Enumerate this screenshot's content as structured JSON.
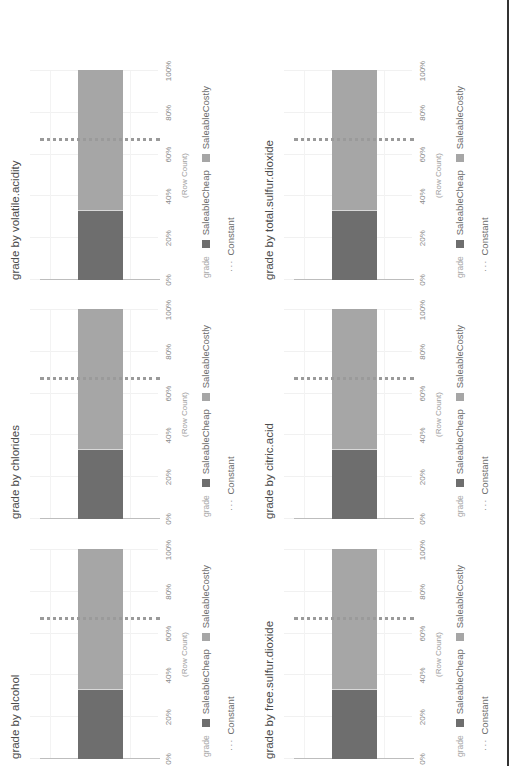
{
  "page": {
    "orientation": "rotated-90-ccw",
    "colors": {
      "saleable_cheap": "#6e6e6e",
      "saleable_costly": "#a6a6a6",
      "constant_line": "#9a9a9a",
      "axis": "#bdbdbd"
    }
  },
  "legend": {
    "title": "grade",
    "items": [
      {
        "label": "SaleableCheap",
        "color": "#6e6e6e"
      },
      {
        "label": "SaleableCostly",
        "color": "#a6a6a6"
      }
    ],
    "constant_label": "Constant",
    "constant_glyph": "···"
  },
  "axis": {
    "title": "(Row Count)",
    "ticks": [
      "0%",
      "20%",
      "40%",
      "60%",
      "80%",
      "100%"
    ]
  },
  "charts": [
    {
      "title": "grade by alcohol"
    },
    {
      "title": "grade by chlorides"
    },
    {
      "title": "grade by volatile.acidity"
    },
    {
      "title": "grade by free.sulfur.dioxide"
    },
    {
      "title": "grade by citric.acid"
    },
    {
      "title": "grade by total.sulfur.dioxide"
    }
  ],
  "chart_data": [
    {
      "type": "bar",
      "orientation": "horizontal-stacked-100",
      "title": "grade by alcohol",
      "categories": [
        ""
      ],
      "series": [
        {
          "name": "SaleableCheap",
          "values": [
            33
          ]
        },
        {
          "name": "SaleableCostly",
          "values": [
            67
          ]
        }
      ],
      "reference_line": {
        "name": "Constant",
        "value": 67
      },
      "xlabel": "(Row Count)",
      "xticks": [
        "0%",
        "20%",
        "40%",
        "60%",
        "80%",
        "100%"
      ],
      "xlim": [
        0,
        100
      ],
      "legend_title": "grade",
      "legend_position": "bottom",
      "grid": true
    },
    {
      "type": "bar",
      "orientation": "horizontal-stacked-100",
      "title": "grade by chlorides",
      "categories": [
        ""
      ],
      "series": [
        {
          "name": "SaleableCheap",
          "values": [
            33
          ]
        },
        {
          "name": "SaleableCostly",
          "values": [
            67
          ]
        }
      ],
      "reference_line": {
        "name": "Constant",
        "value": 67
      },
      "xlabel": "(Row Count)",
      "xticks": [
        "0%",
        "20%",
        "40%",
        "60%",
        "80%",
        "100%"
      ],
      "xlim": [
        0,
        100
      ],
      "legend_title": "grade",
      "legend_position": "bottom",
      "grid": true
    },
    {
      "type": "bar",
      "orientation": "horizontal-stacked-100",
      "title": "grade by volatile.acidity",
      "categories": [
        ""
      ],
      "series": [
        {
          "name": "SaleableCheap",
          "values": [
            33
          ]
        },
        {
          "name": "SaleableCostly",
          "values": [
            67
          ]
        }
      ],
      "reference_line": {
        "name": "Constant",
        "value": 67
      },
      "xlabel": "(Row Count)",
      "xticks": [
        "0%",
        "20%",
        "40%",
        "60%",
        "80%",
        "100%"
      ],
      "xlim": [
        0,
        100
      ],
      "legend_title": "grade",
      "legend_position": "bottom",
      "grid": true
    },
    {
      "type": "bar",
      "orientation": "horizontal-stacked-100",
      "title": "grade by free.sulfur.dioxide",
      "categories": [
        ""
      ],
      "series": [
        {
          "name": "SaleableCheap",
          "values": [
            33
          ]
        },
        {
          "name": "SaleableCostly",
          "values": [
            67
          ]
        }
      ],
      "reference_line": {
        "name": "Constant",
        "value": 67
      },
      "xlabel": "(Row Count)",
      "xticks": [
        "0%",
        "20%",
        "40%",
        "60%",
        "80%",
        "100%"
      ],
      "xlim": [
        0,
        100
      ],
      "legend_title": "grade",
      "legend_position": "bottom",
      "grid": true
    },
    {
      "type": "bar",
      "orientation": "horizontal-stacked-100",
      "title": "grade by citric.acid",
      "categories": [
        ""
      ],
      "series": [
        {
          "name": "SaleableCheap",
          "values": [
            33
          ]
        },
        {
          "name": "SaleableCostly",
          "values": [
            67
          ]
        }
      ],
      "reference_line": {
        "name": "Constant",
        "value": 67
      },
      "xlabel": "(Row Count)",
      "xticks": [
        "0%",
        "20%",
        "40%",
        "60%",
        "80%",
        "100%"
      ],
      "xlim": [
        0,
        100
      ],
      "legend_title": "grade",
      "legend_position": "bottom",
      "grid": true
    },
    {
      "type": "bar",
      "orientation": "horizontal-stacked-100",
      "title": "grade by total.sulfur.dioxide",
      "categories": [
        ""
      ],
      "series": [
        {
          "name": "SaleableCheap",
          "values": [
            33
          ]
        },
        {
          "name": "SaleableCostly",
          "values": [
            67
          ]
        }
      ],
      "reference_line": {
        "name": "Constant",
        "value": 67
      },
      "xlabel": "(Row Count)",
      "xticks": [
        "0%",
        "20%",
        "40%",
        "60%",
        "80%",
        "100%"
      ],
      "xlim": [
        0,
        100
      ],
      "legend_title": "grade",
      "legend_position": "bottom",
      "grid": true
    }
  ]
}
